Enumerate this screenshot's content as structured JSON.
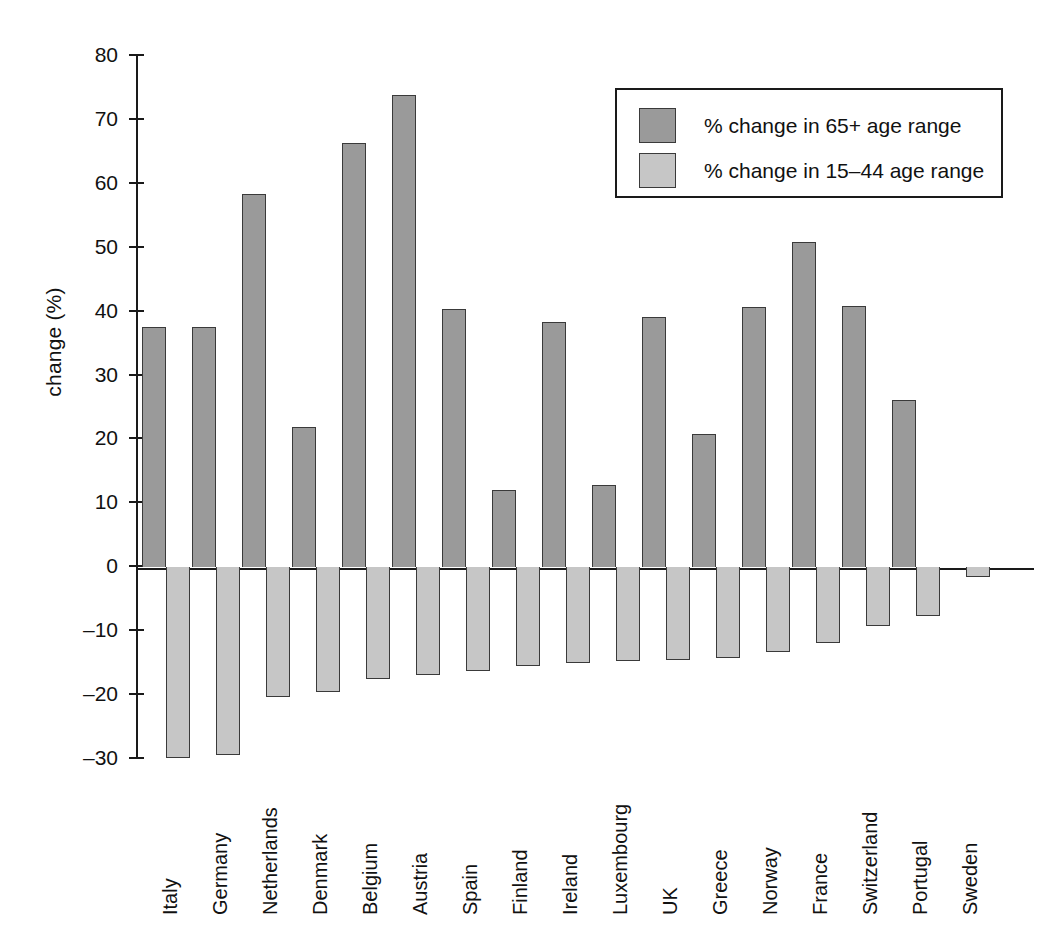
{
  "chart_data": {
    "type": "bar",
    "title": "",
    "subtitle": "",
    "xlabel": "",
    "ylabel": "change (%)",
    "ylim": [
      -30,
      80
    ],
    "ytick_labels": [
      "80",
      "70",
      "60",
      "50",
      "40",
      "30",
      "20",
      "10",
      "0",
      "–10",
      "–20",
      "–30"
    ],
    "ytick_values": [
      80,
      70,
      60,
      50,
      40,
      30,
      20,
      10,
      0,
      -10,
      -20,
      -30
    ],
    "grid": false,
    "legend_position": "upper-right",
    "orientation": "vertical",
    "grouped": true,
    "categories": [
      "Italy",
      "Germany",
      "Netherlands",
      "Denmark",
      "Belgium",
      "Austria",
      "Spain",
      "Finland",
      "Ireland",
      "Luxembourg",
      "UK",
      "Greece",
      "Norway",
      "France",
      "Switzerland",
      "Portugal",
      "Sweden"
    ],
    "series": [
      {
        "name": "% change in 65+ age range",
        "color": "#9a9a9a",
        "values": [
          37.5,
          37.5,
          58.2,
          21.8,
          66.2,
          73.7,
          40.2,
          12.0,
          38.3,
          12.7,
          39.0,
          20.7,
          40.6,
          50.7,
          40.7,
          26.0,
          0.0
        ]
      },
      {
        "name": "% change in 15–44 age range",
        "color": "#c6c6c6",
        "values": [
          -29.8,
          -29.3,
          -20.3,
          -19.5,
          -17.5,
          -16.9,
          -16.3,
          -15.5,
          -15.0,
          -14.7,
          -14.5,
          -14.2,
          -13.3,
          -11.8,
          -9.2,
          -7.7,
          -1.5
        ]
      }
    ],
    "note_netherlands_pair": "Netherlands 65+ bar drawn at 20.0; Denmark 65+ at 21.8"
  },
  "legend": {
    "items": [
      {
        "label": "% change in 65+ age range",
        "color": "#9a9a9a"
      },
      {
        "label": "% change in 15–44 age range",
        "color": "#c6c6c6"
      }
    ]
  },
  "axes": {
    "y_title": "change (%)"
  }
}
